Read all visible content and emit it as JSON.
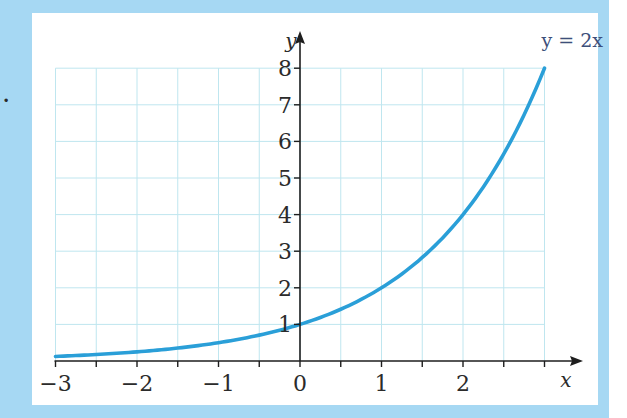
{
  "figure": {
    "partial_label": ".",
    "colors": {
      "frame": "#a6d8f3",
      "panel": "#ffffff",
      "grid": "#bfe6ef",
      "curve": "#2a9fd8",
      "axis": "#1e1e1e",
      "label": "#3d4f7a"
    }
  },
  "chart_data": {
    "type": "line",
    "title": "",
    "function": "y = 2^x",
    "curve_label": "y = 2x",
    "xlabel": "x",
    "ylabel": "y",
    "xlim": [
      -3,
      3
    ],
    "ylim": [
      0,
      8
    ],
    "x_ticks": [
      -3,
      -2.5,
      -2,
      -1.5,
      -1,
      -0.5,
      0,
      0.5,
      1,
      1.5,
      2,
      2.5,
      3
    ],
    "x_tick_labels": [
      "−3",
      "−2",
      "−1",
      "0",
      "1",
      "2"
    ],
    "x_tick_label_values": [
      -3,
      -2,
      -1,
      0,
      1,
      2
    ],
    "y_tick_labels": [
      "1",
      "2",
      "3",
      "4",
      "5",
      "6",
      "7",
      "8"
    ],
    "y_tick_label_values": [
      1,
      2,
      3,
      4,
      5,
      6,
      7,
      8
    ],
    "grid": true,
    "grid_x_step": 0.5,
    "grid_y_step": 1,
    "series": [
      {
        "name": "y = 2x",
        "x": [
          -3,
          -2.5,
          -2,
          -1.5,
          -1,
          -0.5,
          0,
          0.5,
          1,
          1.5,
          2,
          2.5,
          3
        ],
        "values": [
          0.125,
          0.177,
          0.25,
          0.354,
          0.5,
          0.707,
          1,
          1.414,
          2,
          2.828,
          4,
          5.657,
          8
        ]
      }
    ]
  }
}
